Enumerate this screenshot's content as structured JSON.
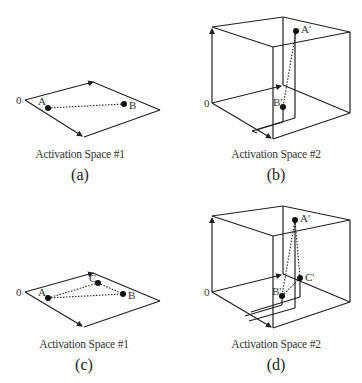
{
  "panels": [
    {
      "id": "a",
      "caption": "Activation Space #1",
      "sublabel": "(a)",
      "origin_label": "0",
      "points": [
        {
          "name": "A",
          "label": "A"
        },
        {
          "name": "B",
          "label": "B"
        }
      ]
    },
    {
      "id": "b",
      "caption": "Activation Space #2",
      "sublabel": "(b)",
      "origin_label": "0",
      "points": [
        {
          "name": "A-prime",
          "label": "A'"
        },
        {
          "name": "B-prime",
          "label": "B'"
        }
      ]
    },
    {
      "id": "c",
      "caption": "Activation Space #1",
      "sublabel": "(c)",
      "origin_label": "0",
      "points": [
        {
          "name": "A",
          "label": "A"
        },
        {
          "name": "B",
          "label": "B"
        },
        {
          "name": "C",
          "label": "C"
        }
      ]
    },
    {
      "id": "d",
      "caption": "Activation Space #2",
      "sublabel": "(d)",
      "origin_label": "0",
      "points": [
        {
          "name": "A-prime",
          "label": "A'"
        },
        {
          "name": "B-prime",
          "label": "B'"
        },
        {
          "name": "C-prime",
          "label": "C'"
        }
      ]
    }
  ],
  "colors": {
    "line": "#222222",
    "background": "#ffffff"
  }
}
